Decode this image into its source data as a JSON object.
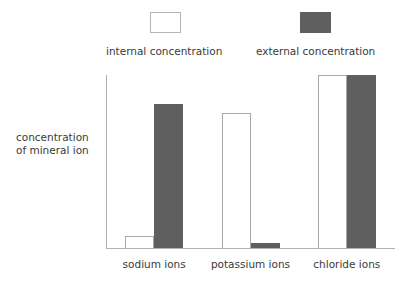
{
  "chart_data": {
    "type": "bar",
    "title": "",
    "xlabel": "",
    "ylabel": "concentration of mineral ion",
    "ylabel_lines": [
      "concentration",
      "of mineral ion"
    ],
    "categories": [
      "sodium ions",
      "potassium ions",
      "chloride ions"
    ],
    "series": [
      {
        "name": "internal concentration",
        "color": "#ffffff",
        "border_color": "#a8a8a8",
        "values": [
          7,
          78,
          100
        ]
      },
      {
        "name": "external concentration",
        "color": "#5f5f5f",
        "border_color": "#5f5f5f",
        "values": [
          83,
          3,
          100
        ]
      }
    ],
    "ylim": [
      0,
      100
    ],
    "y_tick_labels": [],
    "grid": false,
    "legend_position": "top"
  },
  "legend": {
    "entries": [
      {
        "label": "internal concentration",
        "swatch": "white-square-outline"
      },
      {
        "label": "external concentration",
        "swatch": "dark-gray-square-filled"
      }
    ]
  },
  "axis": {
    "y_title_line1": "concentration",
    "y_title_line2": "of mineral ion"
  },
  "colors": {
    "external_fill": "#5f5f5f",
    "internal_fill": "#ffffff",
    "internal_stroke": "#a8a8a8",
    "axis_line": "#b0b0b0",
    "text": "#3a3a3a",
    "background": "#ffffff"
  }
}
